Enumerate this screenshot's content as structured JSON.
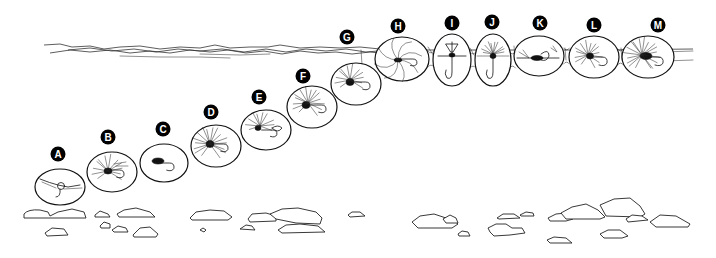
{
  "figure": {
    "title": "",
    "colors": {
      "ink": "#111111",
      "background": "#ffffff",
      "label_bg": "#000000",
      "label_text": "#ffffff"
    }
  },
  "water_surface": {
    "y": 50,
    "x_start": 44,
    "x_end": 693
  },
  "flies": [
    {
      "label": "A",
      "label_x": 58,
      "label_y": 154,
      "cx": 60,
      "cy": 187,
      "rx": 25,
      "ry": 18,
      "type": "nymph-weighted"
    },
    {
      "label": "B",
      "label_x": 108,
      "label_y": 137,
      "cx": 112,
      "cy": 172,
      "rx": 25,
      "ry": 20,
      "type": "wet-fly-hackled"
    },
    {
      "label": "C",
      "label_x": 163,
      "label_y": 129,
      "cx": 164,
      "cy": 163,
      "rx": 24,
      "ry": 19,
      "type": "nymph"
    },
    {
      "label": "D",
      "label_x": 211,
      "label_y": 112,
      "cx": 216,
      "cy": 146,
      "rx": 25,
      "ry": 21,
      "type": "soft-hackle"
    },
    {
      "label": "E",
      "label_x": 259,
      "label_y": 97,
      "cx": 266,
      "cy": 130,
      "rx": 25,
      "ry": 20,
      "type": "emerger"
    },
    {
      "label": "F",
      "label_x": 303,
      "label_y": 76,
      "cx": 312,
      "cy": 107,
      "rx": 25,
      "ry": 21,
      "type": "wet-fly"
    },
    {
      "label": "G",
      "label_x": 347,
      "label_y": 37,
      "cx": 356,
      "cy": 84,
      "rx": 25,
      "ry": 21,
      "type": "wet-fly-near-surface"
    },
    {
      "label": "H",
      "label_x": 398,
      "label_y": 26,
      "cx": 402,
      "cy": 59,
      "rx": 27,
      "ry": 22,
      "type": "spider-in-film"
    },
    {
      "label": "I",
      "label_x": 452,
      "label_y": 23,
      "cx": 452,
      "cy": 60,
      "rx": 19,
      "ry": 26,
      "type": "emerger-hanging"
    },
    {
      "label": "J",
      "label_x": 492,
      "label_y": 22,
      "cx": 493,
      "cy": 60,
      "rx": 18,
      "ry": 26,
      "type": "parachute-emerger"
    },
    {
      "label": "K",
      "label_x": 540,
      "label_y": 23,
      "cx": 539,
      "cy": 56,
      "rx": 25,
      "ry": 20,
      "type": "spinner"
    },
    {
      "label": "L",
      "label_x": 594,
      "label_y": 25,
      "cx": 594,
      "cy": 57,
      "rx": 25,
      "ry": 21,
      "type": "dry-fly"
    },
    {
      "label": "M",
      "label_x": 658,
      "label_y": 25,
      "cx": 648,
      "cy": 57,
      "rx": 26,
      "ry": 21,
      "type": "dry-fly-hackled"
    }
  ],
  "riverbed": {
    "rocks": [
      "M24,214 Q28,209 40,210 L48,212 L50,216 L58,212 L72,209 L84,212 L86,218 L24,218 Z",
      "M95,215 L100,211 L108,214 L110,217 L95,217 Z",
      "M117,214 L124,210 L136,208 L150,212 L155,217 L119,217 Z",
      "M45,233 L52,228 L64,229 L68,235 L47,236 Z",
      "M100,226 L104,222 L110,224 L110,228 L101,228 Z",
      "M112,230 L118,226 L126,228 L128,232 L114,232 Z",
      "M133,235 L140,228 L150,227 L158,234 L156,237 L134,237 Z",
      "M190,218 L196,212 L210,210 L224,211 L232,217 L228,220 L192,220 Z",
      "M200,230 L203,228 L206,230 L204,232 Z",
      "M240,229 L246,225 L252,226 L255,230 Z",
      "M248,219 L252,214 L266,213 L276,216 L276,221 L250,222 Z",
      "M270,214 L282,209 L298,208 L316,212 L322,218 L320,224 L296,223 L276,219 Z",
      "M278,230 L286,225 L300,224 L318,226 L325,232 L282,233 Z",
      "M348,215 L352,212 L360,212 L365,216 L350,217 Z",
      "M412,222 L420,216 L434,214 L446,218 L452,219 L458,224 L452,228 L418,228 Z",
      "M443,219 L450,215 L456,218 L458,223 L446,223 Z",
      "M458,234 L462,231 L468,232 L470,236 L459,236 Z",
      "M497,218 L503,214 L514,214 L520,218 L499,219 Z",
      "M520,215 L526,212 L533,213 L534,216 L521,216 Z",
      "M488,228 L496,224 L506,224 L512,228 L522,228 L525,233 L510,235 L494,236 L490,232 Z",
      "M548,218 L556,214 L566,213 L573,219 L566,221 L550,221 Z",
      "M561,213 L572,207 L586,204 L598,210 L605,217 L600,219 L566,219 Z",
      "M600,205 L614,199 L630,198 L640,206 L645,214 L640,217 L606,216 Z",
      "M626,219 L632,215 L642,216 L648,220 L628,222 Z",
      "M650,222 L660,215 L676,216 L690,224 L688,227 L656,227 Z",
      "M600,234 L608,230 L620,230 L628,236 L622,238 L604,238 Z",
      "M547,240 L554,237 L566,238 L572,243 L550,243 Z"
    ]
  }
}
